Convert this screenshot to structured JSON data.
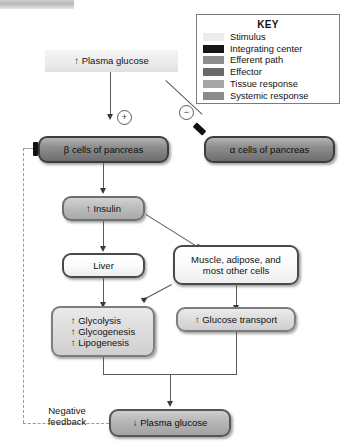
{
  "diagram": {
    "nodes": {
      "stimulus": {
        "label": "↑ Plasma glucose",
        "key_class": "Stimulus"
      },
      "beta_cells": {
        "label": "β cells of pancreas",
        "key_class": "Integrating center"
      },
      "alpha_cells": {
        "label": "α cells of pancreas",
        "key_class": "Integrating center"
      },
      "insulin": {
        "label": "↑ Insulin",
        "key_class": "Efferent path"
      },
      "liver": {
        "label": "Liver",
        "key_class": "Effector"
      },
      "muscle": {
        "label": "Muscle, adipose, and most other cells",
        "key_class": "Effector"
      },
      "metabolism": {
        "line1": "↑ Glycolysis",
        "line2": "↑ Glycogenesis",
        "line3": "↑ Lipogenesis",
        "key_class": "Tissue response"
      },
      "glucose_transport": {
        "label": "↑ Glucose transport",
        "key_class": "Tissue response"
      },
      "plasma_glucose_down": {
        "label": "↓ Plasma glucose",
        "key_class": "Systemic response"
      }
    },
    "signs": {
      "stimulatory": "⊕",
      "stimulatory_symbol": "+",
      "inhibitory": "⊖",
      "inhibitory_symbol": "−"
    },
    "feedback": {
      "line1": "Negative",
      "line2": "feedback"
    }
  },
  "key": {
    "title": "KEY",
    "entries": [
      {
        "label": "Stimulus",
        "color": "#ececec"
      },
      {
        "label": "Integrating center",
        "color": "#151515"
      },
      {
        "label": "Efferent path",
        "color": "#8e8e8e"
      },
      {
        "label": "Effector",
        "color": "#6b6b6b"
      },
      {
        "label": "Tissue response",
        "color": "#a6a6a6"
      },
      {
        "label": "Systemic response",
        "color": "#8a8a8a"
      }
    ]
  }
}
